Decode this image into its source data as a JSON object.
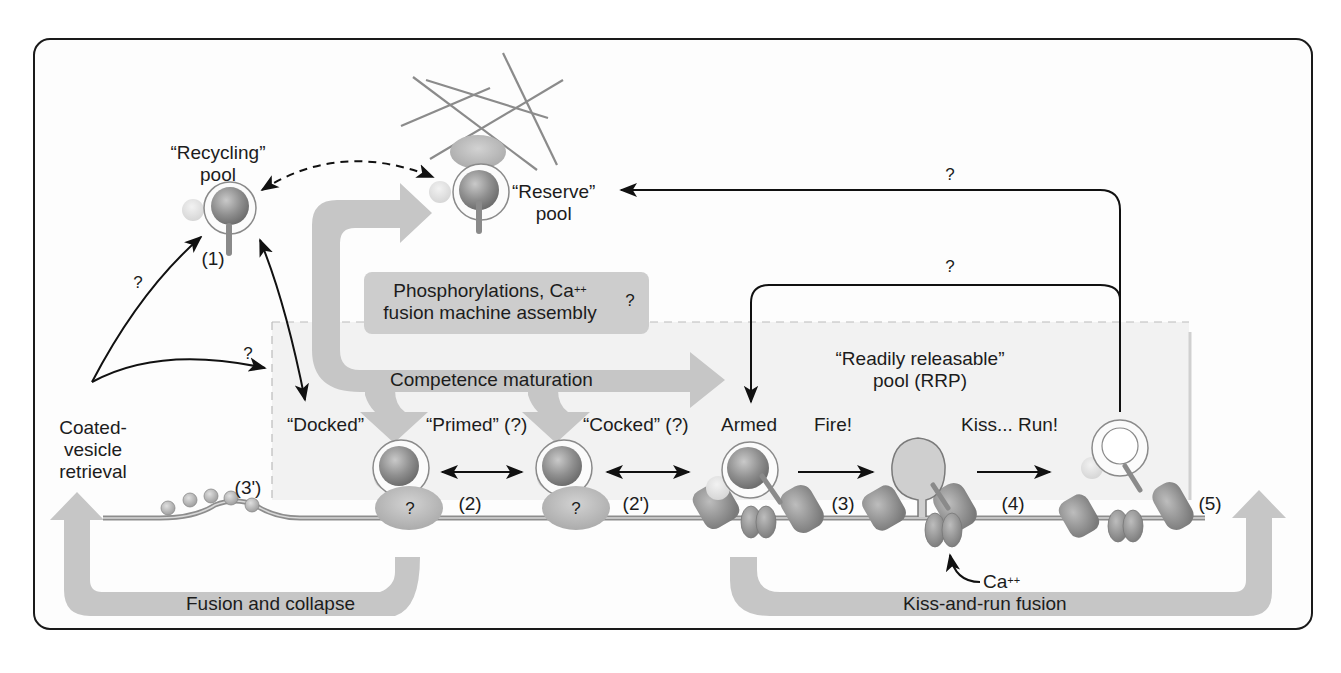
{
  "figure": {
    "type": "diagram",
    "colors": {
      "frame": "#1a1a1a",
      "thick_arrow_gray": "#c4c4c4",
      "rrp_region": "#f2f2f2",
      "vesicle_fill": "#9a9a9a",
      "protein_fill": "#8c8c8c",
      "text": "#1c1c1c"
    }
  },
  "pools": {
    "recycling": {
      "line1": "“Recycling”",
      "line2": "pool",
      "step": "(1)"
    },
    "reserve": {
      "line1": "“Reserve”",
      "line2": "pool"
    },
    "rrp": {
      "line1": "“Readily releasable”",
      "line2": "pool (RRP)"
    }
  },
  "process_box": {
    "line1": "Phosphorylations, Ca",
    "line1_sup": "++",
    "line2": "fusion machine assembly",
    "question": "?"
  },
  "big_arrows": {
    "competence": "Competence maturation",
    "fusion_collapse": "Fusion and collapse",
    "kiss_run_fusion": "Kiss-and-run fusion"
  },
  "retrieval": {
    "line1": "Coated-",
    "line2": "vesicle",
    "line3": "retrieval",
    "step": "(3')"
  },
  "stages": [
    {
      "label": "“Docked”",
      "protein_label": "?"
    },
    {
      "label": "“Primed” (?)",
      "protein_label": "?"
    },
    {
      "label": "“Cocked” (?)"
    },
    {
      "label": "Armed"
    },
    {
      "label": "Fire!"
    },
    {
      "label": "Kiss... Run!"
    }
  ],
  "steps": {
    "s2": "(2)",
    "s2p": "(2')",
    "s3": "(3)",
    "s4": "(4)",
    "s5": "(5)"
  },
  "calcium": {
    "label": "Ca",
    "sup": "++"
  },
  "question_marks": {
    "retrieval_to_recycling": "?",
    "retrieval_to_rrp": "?",
    "kissrun_to_reserve": "?",
    "kissrun_to_armed": "?"
  }
}
